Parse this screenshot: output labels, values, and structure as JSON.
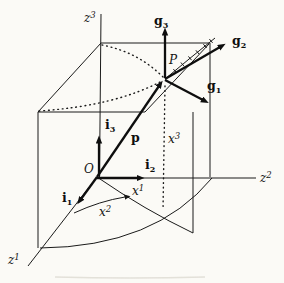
{
  "figure": {
    "colors": {
      "ink": "#161616",
      "background": "#fbfaf6",
      "smudge": "#d9d6cd"
    },
    "labels": {
      "z1": {
        "base": "z",
        "script": "1"
      },
      "z2": {
        "base": "z",
        "script": "2"
      },
      "z3": {
        "base": "z",
        "script": "3"
      },
      "x1": {
        "base": "x",
        "script": "1"
      },
      "x2": {
        "base": "x",
        "script": "2"
      },
      "x3": {
        "base": "x",
        "script": "3"
      },
      "i1": {
        "base": "i",
        "script": "1"
      },
      "i2": {
        "base": "i",
        "script": "2"
      },
      "i3": {
        "base": "i",
        "script": "3"
      },
      "g1": {
        "base": "g",
        "script": "1"
      },
      "g2": {
        "base": "g",
        "script": "2"
      },
      "g3": {
        "base": "g",
        "script": "3"
      },
      "p": {
        "base": "p",
        "script": ""
      },
      "O": {
        "base": "O",
        "script": ""
      },
      "P": {
        "base": "P",
        "script": ""
      }
    }
  }
}
